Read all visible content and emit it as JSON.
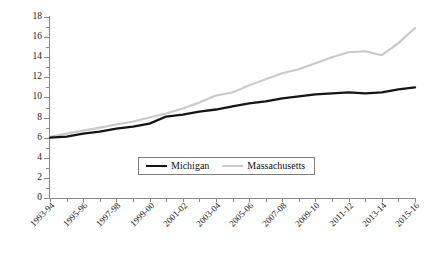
{
  "ghost_header_text": "",
  "chart_data": {
    "type": "line",
    "title": "",
    "xlabel": "",
    "ylabel": "(000s $)",
    "ylim": [
      0,
      18
    ],
    "yticks": [
      0,
      2,
      4,
      6,
      8,
      10,
      12,
      14,
      16,
      18
    ],
    "grid": false,
    "legend_position": "inside-bottom-center",
    "categories": [
      "1993-94",
      "1994-95",
      "1995-96",
      "1996-97",
      "1997-98",
      "1998-99",
      "1999-00",
      "2000-01",
      "2001-02",
      "2002-03",
      "2003-04",
      "2004-05",
      "2005-06",
      "2006-07",
      "2007-08",
      "2008-09",
      "2009-10",
      "2010-11",
      "2011-12",
      "2012-13",
      "2013-14",
      "2014-15",
      "2015-16"
    ],
    "tick_labels_shown": [
      "1993-94",
      "1995-96",
      "1997-98",
      "1999-00",
      "2001-02",
      "2003-04",
      "2005-06",
      "2007-08",
      "2009-10",
      "2011-12",
      "2013-14",
      "2015-16"
    ],
    "series": [
      {
        "name": "Michigan",
        "color": "#151515",
        "values": [
          6.0,
          6.1,
          6.4,
          6.6,
          6.9,
          7.1,
          7.4,
          8.1,
          8.3,
          8.6,
          8.8,
          9.1,
          9.4,
          9.6,
          9.9,
          10.1,
          10.3,
          10.4,
          10.5,
          10.4,
          10.5,
          10.8,
          11.0
        ]
      },
      {
        "name": "Massachusetts",
        "color": "#c9c9c9",
        "values": [
          6.1,
          6.4,
          6.7,
          7.0,
          7.3,
          7.6,
          8.0,
          8.4,
          8.9,
          9.5,
          10.2,
          10.5,
          11.2,
          11.8,
          12.4,
          12.8,
          13.4,
          14.0,
          14.5,
          14.6,
          14.2,
          15.4,
          16.9
        ]
      }
    ]
  },
  "legend": {
    "items": [
      {
        "label": "Michigan"
      },
      {
        "label": "Massachusetts"
      }
    ]
  }
}
